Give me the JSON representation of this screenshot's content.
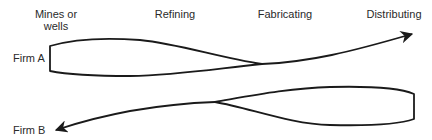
{
  "diagram": {
    "stages": [
      {
        "label_line1": "Mines or",
        "label_line2": "wells"
      },
      {
        "label_line1": "Refining"
      },
      {
        "label_line1": "Fabricating"
      },
      {
        "label_line1": "Distributing"
      }
    ],
    "firms": [
      {
        "label": "Firm A",
        "direction": "forward",
        "arrow_end": "Distributing"
      },
      {
        "label": "Firm B",
        "direction": "backward",
        "arrow_end": "Mines or wells"
      }
    ],
    "stroke_color": "#1a1a1a"
  }
}
